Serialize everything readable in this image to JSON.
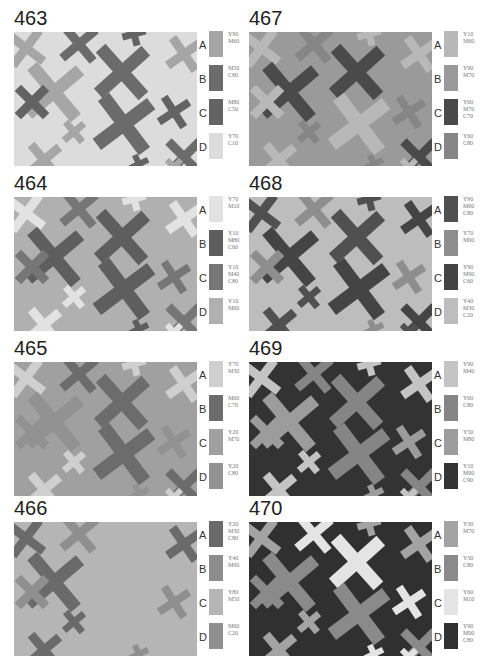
{
  "panels": [
    {
      "number": "463",
      "background": "D",
      "swatches": [
        {
          "letter": "A",
          "codes": [
            "Y90",
            "M60"
          ],
          "color": "#a6a6a6"
        },
        {
          "letter": "B",
          "codes": [
            "M50",
            "C80"
          ],
          "color": "#6b6b6b"
        },
        {
          "letter": "C",
          "codes": [
            "M80",
            "C50"
          ],
          "color": "#636363"
        },
        {
          "letter": "D",
          "codes": [
            "Y70",
            "C10"
          ],
          "color": "#dcdcdc"
        }
      ],
      "shapes": [
        "A",
        "B",
        "C",
        "A",
        "B",
        "A",
        "C",
        "A",
        "B",
        "C",
        "A",
        "B",
        "C",
        "A"
      ]
    },
    {
      "number": "467",
      "background": "B",
      "swatches": [
        {
          "letter": "A",
          "codes": [
            "Y10",
            "M60"
          ],
          "color": "#b8b8b8"
        },
        {
          "letter": "B",
          "codes": [
            "Y90",
            "M70"
          ],
          "color": "#9a9a9a"
        },
        {
          "letter": "C",
          "codes": [
            "Y60",
            "M70",
            "C70"
          ],
          "color": "#4a4a4a"
        },
        {
          "letter": "D",
          "codes": [
            "Y60",
            "C80"
          ],
          "color": "#868686"
        }
      ],
      "shapes": [
        "A",
        "D",
        "A",
        "C",
        "C",
        "A",
        "A",
        "D",
        "A",
        "D",
        "A",
        "C",
        "D",
        "A"
      ]
    },
    {
      "number": "464",
      "background": "D",
      "swatches": [
        {
          "letter": "A",
          "codes": [
            "Y70",
            "M10"
          ],
          "color": "#e2e2e2"
        },
        {
          "letter": "B",
          "codes": [
            "Y10",
            "M80",
            "C60"
          ],
          "color": "#5e5e5e"
        },
        {
          "letter": "C",
          "codes": [
            "Y10",
            "M40",
            "C80"
          ],
          "color": "#767676"
        },
        {
          "letter": "D",
          "codes": [
            "Y10",
            "M60"
          ],
          "color": "#b0b0b0"
        }
      ],
      "shapes": [
        "A",
        "C",
        "A",
        "B",
        "B",
        "A",
        "C",
        "A",
        "B",
        "C",
        "A",
        "C",
        "B",
        "A"
      ]
    },
    {
      "number": "468",
      "background": "D",
      "swatches": [
        {
          "letter": "A",
          "codes": [
            "Y90",
            "M60",
            "C80"
          ],
          "color": "#505050"
        },
        {
          "letter": "B",
          "codes": [
            "Y70",
            "M90"
          ],
          "color": "#8e8e8e"
        },
        {
          "letter": "C",
          "codes": [
            "Y90",
            "M90",
            "C60"
          ],
          "color": "#444444"
        },
        {
          "letter": "D",
          "codes": [
            "Y40",
            "M30",
            "C20"
          ],
          "color": "#bdbdbd"
        }
      ],
      "shapes": [
        "A",
        "B",
        "A",
        "C",
        "A",
        "C",
        "B",
        "A",
        "C",
        "B",
        "A",
        "C",
        "B",
        "A"
      ]
    },
    {
      "number": "465",
      "background": "C",
      "swatches": [
        {
          "letter": "A",
          "codes": [
            "Y70",
            "M30"
          ],
          "color": "#cfcfcf"
        },
        {
          "letter": "B",
          "codes": [
            "M60",
            "C70"
          ],
          "color": "#6c6c6c"
        },
        {
          "letter": "C",
          "codes": [
            "Y20",
            "M70"
          ],
          "color": "#a0a0a0"
        },
        {
          "letter": "D",
          "codes": [
            "Y20",
            "C80"
          ],
          "color": "#929292"
        }
      ],
      "shapes": [
        "A",
        "B",
        "A",
        "D",
        "B",
        "A",
        "D",
        "A",
        "B",
        "D",
        "A",
        "B",
        "D",
        "A"
      ]
    },
    {
      "number": "469",
      "background": "D",
      "swatches": [
        {
          "letter": "A",
          "codes": [
            "Y90",
            "M40"
          ],
          "color": "#c4c4c4"
        },
        {
          "letter": "B",
          "codes": [
            "Y60",
            "C80"
          ],
          "color": "#858585"
        },
        {
          "letter": "C",
          "codes": [
            "Y50",
            "M80"
          ],
          "color": "#9c9c9c"
        },
        {
          "letter": "D",
          "codes": [
            "Y10",
            "M90",
            "C90"
          ],
          "color": "#333333"
        }
      ],
      "shapes": [
        "A",
        "B",
        "A",
        "C",
        "B",
        "A",
        "C",
        "A",
        "B",
        "C",
        "A",
        "B",
        "C",
        "A"
      ]
    },
    {
      "number": "466",
      "background": "C",
      "swatches": [
        {
          "letter": "A",
          "codes": [
            "Y20",
            "M30",
            "C80"
          ],
          "color": "#6a6a6a"
        },
        {
          "letter": "B",
          "codes": [
            "Y40",
            "M90"
          ],
          "color": "#8c8c8c"
        },
        {
          "letter": "C",
          "codes": [
            "Y80",
            "M50"
          ],
          "color": "#b5b5b5"
        },
        {
          "letter": "D",
          "codes": [
            "M60",
            "C20"
          ],
          "color": "#8f8f8f"
        }
      ],
      "shapes": [
        "A",
        "D",
        "C",
        "A",
        "C",
        "A",
        "D",
        "A",
        "C",
        "D",
        "A",
        "C",
        "D",
        "C"
      ]
    },
    {
      "number": "470",
      "background": "D",
      "swatches": [
        {
          "letter": "A",
          "codes": [
            "Y30",
            "M70"
          ],
          "color": "#a3a3a3"
        },
        {
          "letter": "B",
          "codes": [
            "Y30",
            "C80"
          ],
          "color": "#8a8a8a"
        },
        {
          "letter": "C",
          "codes": [
            "Y60",
            "M10"
          ],
          "color": "#e4e4e4"
        },
        {
          "letter": "D",
          "codes": [
            "Y90",
            "M90",
            "C80"
          ],
          "color": "#303030"
        }
      ],
      "shapes": [
        "A",
        "C",
        "A",
        "B",
        "C",
        "A",
        "B",
        "A",
        "B",
        "C",
        "A",
        "B",
        "C",
        "C"
      ]
    }
  ],
  "layout": {
    "order": [
      0,
      1,
      2,
      3,
      4,
      5,
      6,
      7
    ]
  },
  "x_shapes": [
    {
      "cx": 12,
      "cy": 16,
      "size": 22,
      "w": 9,
      "rot": -8
    },
    {
      "cx": 65,
      "cy": 12,
      "size": 22,
      "w": 9,
      "rot": 5
    },
    {
      "cx": 120,
      "cy": 2,
      "size": 12,
      "w": 7,
      "rot": 30
    },
    {
      "cx": 40,
      "cy": 60,
      "size": 34,
      "w": 13,
      "rot": 5
    },
    {
      "cx": 108,
      "cy": 40,
      "size": 32,
      "w": 13,
      "rot": 3
    },
    {
      "cx": 170,
      "cy": 22,
      "size": 20,
      "w": 9,
      "rot": 10
    },
    {
      "cx": 18,
      "cy": 70,
      "size": 20,
      "w": 9,
      "rot": 0
    },
    {
      "cx": 60,
      "cy": 100,
      "size": 13,
      "w": 7,
      "rot": 5
    },
    {
      "cx": 110,
      "cy": 92,
      "size": 34,
      "w": 14,
      "rot": 8
    },
    {
      "cx": 160,
      "cy": 80,
      "size": 18,
      "w": 8,
      "rot": 12
    },
    {
      "cx": 30,
      "cy": 128,
      "size": 20,
      "w": 9,
      "rot": 5
    },
    {
      "cx": 170,
      "cy": 125,
      "size": 22,
      "w": 9,
      "rot": 0
    },
    {
      "cx": 125,
      "cy": 132,
      "size": 10,
      "w": 6,
      "rot": 20
    },
    {
      "cx": 160,
      "cy": 135,
      "size": 10,
      "w": 6,
      "rot": 0
    }
  ]
}
